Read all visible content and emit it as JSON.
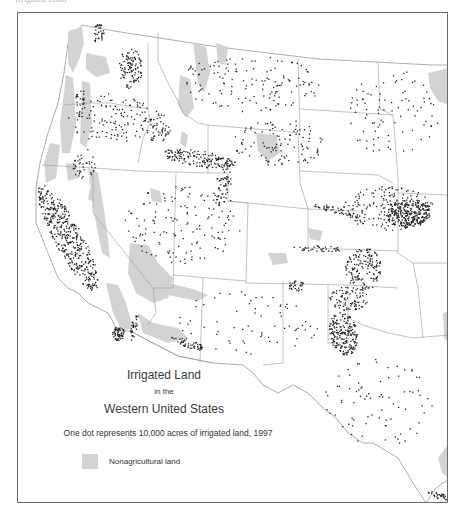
{
  "header": {
    "clipped_text": "Irrigated Land"
  },
  "map": {
    "title_line1": "Irrigated Land",
    "title_line2": "in the",
    "title_line3": "Western United States",
    "caption": "One dot represents 10,000 acres of irrigated land, 1997",
    "legend": [
      {
        "label": "Nonagricultural land",
        "color": "#d3d3d3"
      }
    ],
    "colors": {
      "frame": "#6a6a6a",
      "state_border": "#9a9a9a",
      "nonag_land": "#d3d3d3",
      "dot": "#222222",
      "background": "#ffffff"
    },
    "dot_value_acres": 10000,
    "year": 1997,
    "dot_clusters": [
      {
        "region": "Central Valley CA",
        "cx": 50,
        "cy": 225,
        "rx": 14,
        "ry": 60,
        "n": 420,
        "rot": -28
      },
      {
        "region": "Snake River Plain ID",
        "cx": 180,
        "cy": 145,
        "rx": 38,
        "ry": 8,
        "n": 160,
        "rot": 8
      },
      {
        "region": "Columbia Basin WA",
        "cx": 112,
        "cy": 55,
        "rx": 12,
        "ry": 20,
        "n": 110,
        "rot": 0
      },
      {
        "region": "Skagit WA",
        "cx": 80,
        "cy": 20,
        "rx": 6,
        "ry": 10,
        "n": 35,
        "rot": 0
      },
      {
        "region": "Nebraska Platte",
        "cx": 390,
        "cy": 200,
        "rx": 22,
        "ry": 14,
        "n": 260,
        "rot": -5
      },
      {
        "region": "Nebraska wide",
        "cx": 370,
        "cy": 195,
        "rx": 45,
        "ry": 22,
        "n": 200,
        "rot": 0
      },
      {
        "region": "Kansas SW",
        "cx": 345,
        "cy": 255,
        "rx": 18,
        "ry": 22,
        "n": 150,
        "rot": 0
      },
      {
        "region": "Texas High Plains",
        "cx": 325,
        "cy": 320,
        "rx": 14,
        "ry": 22,
        "n": 200,
        "rot": -10
      },
      {
        "region": "OK/TX panhandle",
        "cx": 330,
        "cy": 285,
        "rx": 20,
        "ry": 12,
        "n": 90,
        "rot": 0
      },
      {
        "region": "Imperial Valley CA",
        "cx": 100,
        "cy": 320,
        "rx": 6,
        "ry": 7,
        "n": 60,
        "rot": 0
      },
      {
        "region": "Colorado River",
        "cx": 115,
        "cy": 315,
        "rx": 3,
        "ry": 14,
        "n": 30,
        "rot": 15
      },
      {
        "region": "Gila AZ",
        "cx": 170,
        "cy": 330,
        "rx": 18,
        "ry": 4,
        "n": 50,
        "rot": 18
      },
      {
        "region": "Rio Grande TX",
        "cx": 420,
        "cy": 482,
        "rx": 12,
        "ry": 3,
        "n": 30,
        "rot": 15
      },
      {
        "region": "San Luis CO",
        "cx": 278,
        "cy": 272,
        "rx": 8,
        "ry": 6,
        "n": 30,
        "rot": 0
      },
      {
        "region": "Arkansas CO",
        "cx": 300,
        "cy": 235,
        "rx": 25,
        "ry": 3,
        "n": 35,
        "rot": 2
      },
      {
        "region": "South Platte CO",
        "cx": 315,
        "cy": 196,
        "rx": 28,
        "ry": 3,
        "n": 45,
        "rot": 15
      },
      {
        "region": "Montana scattered",
        "cx": 230,
        "cy": 70,
        "rx": 75,
        "ry": 28,
        "n": 140,
        "rot": 0
      },
      {
        "region": "Oregon scattered",
        "cx": 95,
        "cy": 105,
        "rx": 45,
        "ry": 25,
        "n": 120,
        "rot": 0
      },
      {
        "region": "Nevada/Utah scattered",
        "cx": 165,
        "cy": 210,
        "rx": 60,
        "ry": 40,
        "n": 140,
        "rot": 0
      },
      {
        "region": "Wyoming scattered",
        "cx": 260,
        "cy": 130,
        "rx": 45,
        "ry": 25,
        "n": 110,
        "rot": 0
      },
      {
        "region": "Dakotas scattered",
        "cx": 375,
        "cy": 100,
        "rx": 45,
        "ry": 45,
        "n": 90,
        "rot": 0
      },
      {
        "region": "NM/AZ scattered",
        "cx": 230,
        "cy": 310,
        "rx": 70,
        "ry": 35,
        "n": 70,
        "rot": 0
      },
      {
        "region": "Texas scattered",
        "cx": 360,
        "cy": 390,
        "rx": 55,
        "ry": 45,
        "n": 80,
        "rot": 0
      },
      {
        "region": "Utah Wasatch",
        "cx": 205,
        "cy": 172,
        "rx": 8,
        "ry": 22,
        "n": 60,
        "rot": 10
      },
      {
        "region": "Klamath/Sacramento N",
        "cx": 65,
        "cy": 150,
        "rx": 12,
        "ry": 15,
        "n": 40,
        "rot": 0
      },
      {
        "region": "Idaho panhandle",
        "cx": 140,
        "cy": 115,
        "rx": 12,
        "ry": 15,
        "n": 50,
        "rot": 0
      },
      {
        "region": "Willamette OR",
        "cx": 62,
        "cy": 90,
        "rx": 5,
        "ry": 18,
        "n": 30,
        "rot": 0
      }
    ]
  }
}
